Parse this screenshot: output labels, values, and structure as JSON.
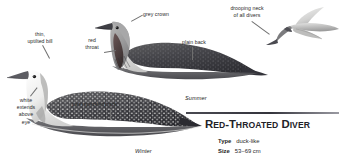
{
  "plate": {
    "species_name_full": "RED-THROATED DIVER",
    "species_name_cap": "R",
    "species_name_rest": "ED-",
    "summer_caption": "Summer",
    "winter_caption": "Winter"
  },
  "callouts": [
    {
      "id": "thin-uptilted-bill",
      "text": "thin,\nuptilted bill"
    },
    {
      "id": "red-throat",
      "text": "red\nthroat"
    },
    {
      "id": "grey-crown",
      "text": "grey crown"
    },
    {
      "id": "plain-back",
      "text": "plain back"
    },
    {
      "id": "drooping-neck",
      "text": "drooping neck\nof all divers"
    },
    {
      "id": "white-above-eye",
      "text": "white\nextends\nabove\neye"
    },
    {
      "id": "pale-speckled-back",
      "text": "pale speckled back"
    }
  ],
  "species_panel": {
    "title": "RED-THROATED DIVER",
    "facts": [
      {
        "key": "Type",
        "value": "duck-like"
      },
      {
        "key": "Size",
        "value": "53–69 cm"
      }
    ]
  },
  "colors": {
    "page_background": "#ffffff",
    "label_text": "#2b2b2b",
    "leader_line": "#6e6e6e",
    "rule": "#34343c",
    "title_text": "#222228",
    "plumage_dark": "#3a3a3c",
    "plumage_mid": "#8d8d90",
    "plumage_pale": "#d8d8d6",
    "throat_red": "#5e4a4a"
  },
  "artwork": {
    "summer_bird": "swimming red-throated diver in summer plumage, grey head, dark red throat patch, plain dark back",
    "winter_bird": "swimming red-throated diver in winter plumage, white face, dark speckled back",
    "flying_bird": "red-throated diver in flight with drooping neck"
  }
}
